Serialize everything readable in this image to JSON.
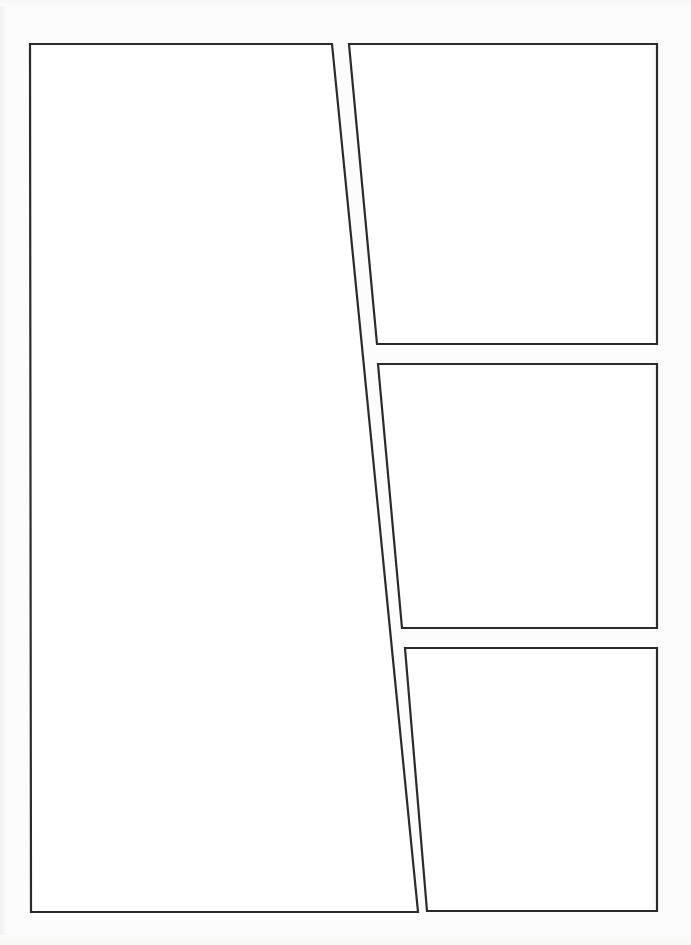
{
  "page": {
    "width": 691,
    "height": 945,
    "background_color": "#fcfcfc",
    "paper_color": "#ffffff",
    "border_color": "#2b2b2b",
    "border_width": 2.2,
    "panel_count": 4,
    "layout_description": "Four empty comic panels: one tall panel occupying the left column with a slanted right edge, and three stacked panels down the right column with slanted left edges.",
    "gutter_style": "angled"
  },
  "panels": [
    {
      "id": "panel-1",
      "label": "Panel 1",
      "position": "left-tall",
      "points": "30,44 332,44 418,912 31,912",
      "content": ""
    },
    {
      "id": "panel-2",
      "label": "Panel 2",
      "position": "right-top",
      "points": "349,44 657,44 657,344 377,344",
      "content": ""
    },
    {
      "id": "panel-3",
      "label": "Panel 3",
      "position": "right-middle",
      "points": "378,364 657,364 657,628 402,628",
      "content": ""
    },
    {
      "id": "panel-4",
      "label": "Panel 4",
      "position": "right-bottom",
      "points": "405,648 657,648 657,911 427,911",
      "content": ""
    }
  ]
}
